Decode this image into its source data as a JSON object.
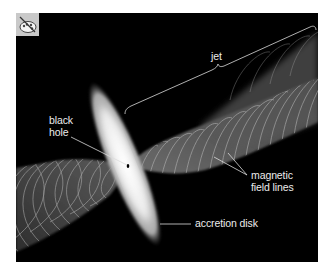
{
  "figure": {
    "title_icon": "palette-icon",
    "background_color": "#000000",
    "labels": {
      "jet": "jet",
      "black_hole_line1": "black",
      "black_hole_line2": "hole",
      "magnetic_line1": "magnetic",
      "magnetic_line2": "field lines",
      "accretion_disk": "accretion disk"
    },
    "components": [
      "jet",
      "black hole",
      "magnetic field lines",
      "accretion disk"
    ],
    "colors": {
      "label_text": "#ececec",
      "leader_lines": "#dcdcdc",
      "disk_core": "#f4f4f4",
      "jet_body": "#6a6a6a",
      "field_lines": "#bdbdbd"
    }
  }
}
